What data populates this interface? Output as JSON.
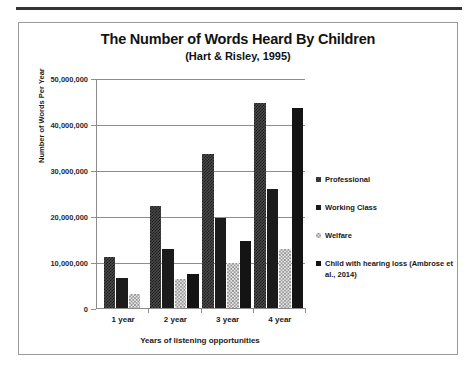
{
  "chart_data": {
    "type": "bar",
    "title": "The Number of Words Heard By Children",
    "subtitle": "(Hart & Risley, 1995)",
    "xlabel": "Years of listening opportunities",
    "ylabel": "Number of Words Per Year",
    "categories": [
      "1 year",
      "2 year",
      "3 year",
      "4 year"
    ],
    "ylim": [
      0,
      50000000
    ],
    "ytick_step": 10000000,
    "ytick_labels": [
      "0",
      "10,000,000",
      "20,000,000",
      "30,000,000",
      "40,000,000",
      "50,000,000"
    ],
    "ytick_values": [
      0,
      10000000,
      20000000,
      30000000,
      40000000,
      50000000
    ],
    "grid": true,
    "legend_position": "right",
    "series": [
      {
        "name": "Professional",
        "texture": "checkered-dark",
        "color": "#3f3f3f",
        "values": [
          11000000,
          22200000,
          33500000,
          44500000
        ]
      },
      {
        "name": "Working Class",
        "texture": "solid-dark",
        "color": "#1b1b1b",
        "values": [
          6500000,
          12800000,
          19500000,
          25900000
        ]
      },
      {
        "name": "Welfare",
        "texture": "checkered-light",
        "color": "#d8d8d8",
        "values": [
          3100000,
          6300000,
          9700000,
          12900000
        ]
      },
      {
        "name": "Child with hearing loss (Ambrose et al., 2014)",
        "texture": "solid-black",
        "color": "#141414",
        "values": [
          null,
          7300000,
          14500000,
          43500000
        ]
      }
    ]
  },
  "frame": {
    "border_color": "#9b9b9b",
    "rule_color": "#333333"
  }
}
